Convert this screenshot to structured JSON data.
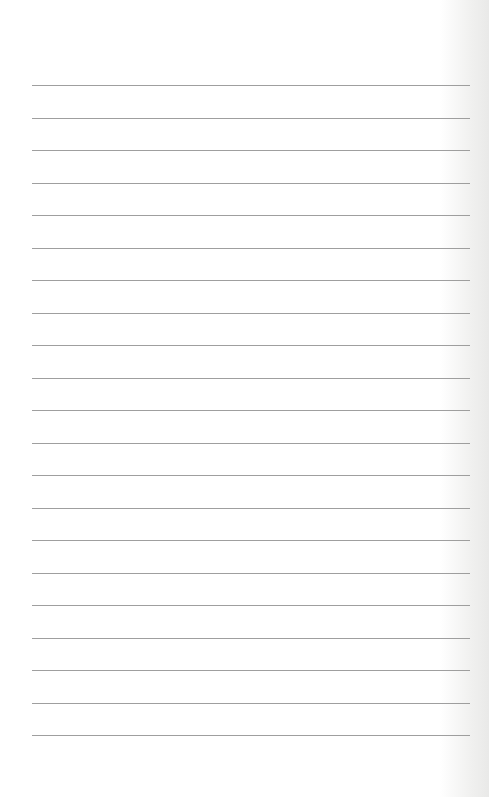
{
  "document": {
    "type": "lined-paper",
    "background_color": "#ffffff",
    "line_color": "#8e8e8e",
    "line_count": 21,
    "first_line_y": 85,
    "line_spacing": 32.5,
    "line_left_x": 32,
    "line_right_x": 470,
    "text_content": ""
  }
}
